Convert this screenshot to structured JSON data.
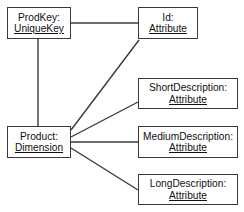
{
  "diagram": {
    "type": "entity-attribute-diagram",
    "background_color": "#ffffff",
    "line_color": "#3a3a3a",
    "text_color": "#101010",
    "nodes": [
      {
        "id": "prodkey",
        "name": "ProdKey:",
        "stereotype": "UniqueKey",
        "x": 7,
        "y": 7,
        "w": 64,
        "h": 32
      },
      {
        "id": "id",
        "name": "Id:",
        "stereotype": "Attribute",
        "x": 138,
        "y": 7,
        "w": 60,
        "h": 32
      },
      {
        "id": "short_description",
        "name": "ShortDescription:",
        "stereotype": "Attribute",
        "x": 138,
        "y": 78,
        "w": 100,
        "h": 31
      },
      {
        "id": "product",
        "name": "Product:",
        "stereotype": "Dimension",
        "x": 7,
        "y": 126,
        "w": 64,
        "h": 32
      },
      {
        "id": "medium_description",
        "name": "MediumDescription:",
        "stereotype": "Attribute",
        "x": 138,
        "y": 126,
        "w": 100,
        "h": 32
      },
      {
        "id": "long_description",
        "name": "LongDescription:",
        "stereotype": "Attribute",
        "x": 138,
        "y": 174,
        "w": 100,
        "h": 31
      }
    ],
    "connectors": [
      {
        "id": "prodkey-to-id",
        "from": "prodkey",
        "to": "id",
        "x1": 71,
        "y1": 23,
        "x2": 138,
        "y2": 23
      },
      {
        "id": "prodkey-to-product",
        "from": "prodkey",
        "to": "product",
        "x1": 38,
        "y1": 39,
        "x2": 38,
        "y2": 126
      },
      {
        "id": "product-to-id",
        "from": "product",
        "to": "id",
        "x1": 71,
        "y1": 130,
        "x2": 139,
        "y2": 40
      },
      {
        "id": "product-to-short",
        "from": "product",
        "to": "short_description",
        "x1": 71,
        "y1": 137,
        "x2": 138,
        "y2": 102
      },
      {
        "id": "product-to-medium",
        "from": "product",
        "to": "medium_description",
        "x1": 71,
        "y1": 142,
        "x2": 138,
        "y2": 142
      },
      {
        "id": "product-to-long",
        "from": "product",
        "to": "long_description",
        "x1": 71,
        "y1": 148,
        "x2": 138,
        "y2": 190
      }
    ]
  }
}
